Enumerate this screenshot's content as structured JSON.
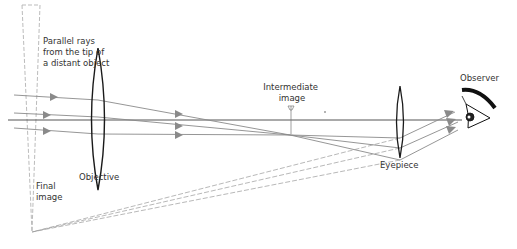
{
  "diagram": {
    "labels": {
      "parallel_rays": [
        "Parallel rays",
        "from the tip of",
        "a distant object"
      ],
      "objective": "Objective",
      "intermediate_image": [
        "Intermediate",
        "image"
      ],
      "eyepiece": "Eyepiece",
      "observer": "Observer",
      "final_image": [
        "Final",
        "image"
      ]
    },
    "colors": {
      "lens": "#1a1a1a",
      "ray": "#8a8a8a",
      "axis": "#555555",
      "dashed": "#9a9a9a",
      "text": "#333333"
    }
  }
}
